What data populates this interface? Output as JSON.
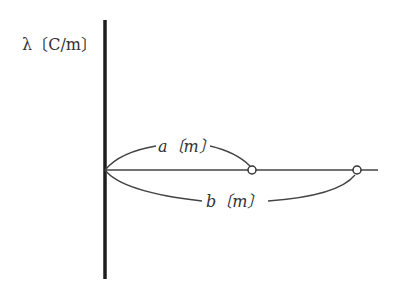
{
  "diagram": {
    "charge_label": "λ〔C/m〕",
    "distance_a_label": "a〔m〕",
    "distance_b_label": "b〔m〕",
    "line_color": "#2a2a2a",
    "point_a": "open-circle",
    "point_b": "open-circle"
  }
}
